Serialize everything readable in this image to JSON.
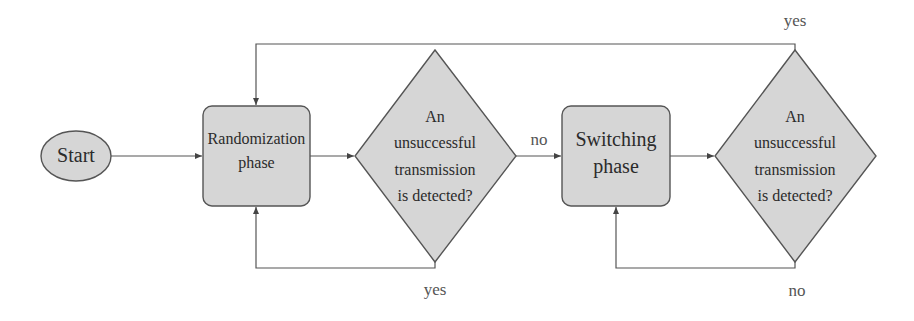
{
  "diagram": {
    "type": "flowchart",
    "colors": {
      "node_fill": "#d6d6d6",
      "node_stroke": "#555555",
      "edge_stroke": "#555555",
      "background": "#ffffff"
    },
    "nodes": {
      "start": {
        "label": "Start",
        "shape": "ellipse"
      },
      "randomization": {
        "line1": "Randomization",
        "line2": "phase",
        "shape": "rounded-rect"
      },
      "decision1": {
        "line1": "An",
        "line2": "unsuccessful",
        "line3": "transmission",
        "line4": "is detected?",
        "shape": "diamond"
      },
      "switching": {
        "line1": "Switching",
        "line2": "phase",
        "shape": "rounded-rect"
      },
      "decision2": {
        "line1": "An",
        "line2": "unsuccessful",
        "line3": "transmission",
        "line4": "is detected?",
        "shape": "diamond"
      }
    },
    "edges": [
      {
        "from": "start",
        "to": "randomization",
        "label": ""
      },
      {
        "from": "randomization",
        "to": "decision1",
        "label": ""
      },
      {
        "from": "decision1",
        "to": "switching",
        "label": "no"
      },
      {
        "from": "decision1",
        "to": "randomization",
        "label": "yes"
      },
      {
        "from": "switching",
        "to": "decision2",
        "label": ""
      },
      {
        "from": "decision2",
        "to": "switching",
        "label": "no"
      },
      {
        "from": "decision2",
        "to": "randomization",
        "label": "yes"
      }
    ],
    "edge_labels": {
      "d1_no": "no",
      "d1_yes": "yes",
      "d2_yes": "yes",
      "d2_no": "no"
    }
  }
}
